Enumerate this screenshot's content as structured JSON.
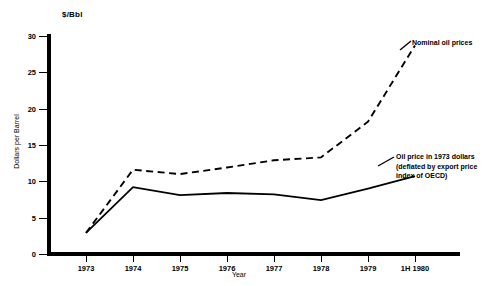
{
  "chart_data": {
    "type": "line",
    "title": "",
    "unit_header": "$/Bbl",
    "xlabel": "Year",
    "ylabel": "Dollars per Barrel",
    "categories": [
      "1973",
      "1974",
      "1975",
      "1976",
      "1977",
      "1978",
      "1979",
      "1H 1980"
    ],
    "ylim": [
      0,
      30
    ],
    "yticks": [
      0,
      5,
      10,
      15,
      20,
      25,
      30
    ],
    "ytick_labels": [
      "0",
      "5",
      "10",
      "15",
      "20",
      "25",
      "30"
    ],
    "grid": false,
    "legend_position": "inline-annotations",
    "series": [
      {
        "name": "Nominal oil prices",
        "style": "dashed",
        "color": "#000000",
        "values": [
          2.9,
          11.6,
          11.0,
          11.9,
          12.9,
          13.3,
          18.2,
          28.7
        ]
      },
      {
        "name": "Oil price in 1973 dollars (deflated by export price index of OECD)",
        "style": "solid",
        "color": "#000000",
        "values": [
          2.9,
          9.2,
          8.1,
          8.4,
          8.2,
          7.4,
          9.0,
          10.7
        ]
      }
    ],
    "annotations": [
      {
        "name": "nominal-oil-prices-label",
        "lines": [
          "Nominal oil prices"
        ]
      },
      {
        "name": "real-oil-price-label",
        "lines": [
          "Oil price in 1973 dollars",
          "(deflated by export price",
          "index of OECD)"
        ]
      }
    ]
  }
}
